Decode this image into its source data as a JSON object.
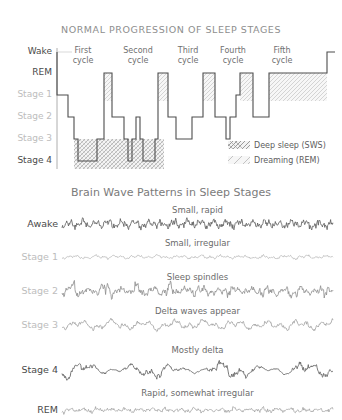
{
  "title": "NORMAL PROGRESSION OF SLEEP STAGES",
  "subtitle": "Brain Wave Patterns in Sleep Stages",
  "hypnogram": {
    "y_axis_labels": [
      {
        "label": "Wake",
        "y": 52,
        "tone": "dark"
      },
      {
        "label": "REM",
        "y": 73,
        "tone": "dark"
      },
      {
        "label": "Stage 1",
        "y": 95,
        "tone": "light"
      },
      {
        "label": "Stage 2",
        "y": 117,
        "tone": "light"
      },
      {
        "label": "Stage 3",
        "y": 139,
        "tone": "light"
      },
      {
        "label": "Stage 4",
        "y": 161,
        "tone": "dark"
      }
    ],
    "cycle_labels": [
      {
        "line1": "First",
        "line2": "cycle",
        "cx": 83
      },
      {
        "line1": "Second",
        "line2": "cycle",
        "cx": 138
      },
      {
        "line1": "Third",
        "line2": "cycle",
        "cx": 188
      },
      {
        "line1": "Fourth",
        "line2": "cycle",
        "cx": 233
      },
      {
        "line1": "Fifth",
        "line2": "cycle",
        "cx": 282
      }
    ],
    "legend": [
      {
        "label": "Deep sleep (SWS)",
        "pattern": "sws-fill"
      },
      {
        "label": "Dreaming (REM)",
        "pattern": "rem-fill"
      }
    ],
    "stage_levels": {
      "Wake": 52,
      "REM": 73,
      "Stage 1": 95,
      "Stage 2": 117,
      "Stage 3": 139,
      "Stage 4": 161
    },
    "trace_color": "#4d4d4d",
    "axis_color": "#9a9a9a",
    "trace_points": [
      [
        57,
        52
      ],
      [
        57,
        95
      ],
      [
        68,
        95
      ],
      [
        68,
        117
      ],
      [
        74,
        117
      ],
      [
        74,
        139
      ],
      [
        78,
        139
      ],
      [
        78,
        161
      ],
      [
        97,
        161
      ],
      [
        97,
        139
      ],
      [
        104,
        139
      ],
      [
        104,
        73
      ],
      [
        112,
        73
      ],
      [
        112,
        117
      ],
      [
        124,
        117
      ],
      [
        124,
        139
      ],
      [
        128,
        139
      ],
      [
        128,
        161
      ],
      [
        132,
        161
      ],
      [
        132,
        139
      ],
      [
        136,
        139
      ],
      [
        136,
        117
      ],
      [
        140,
        117
      ],
      [
        140,
        139
      ],
      [
        143,
        139
      ],
      [
        143,
        161
      ],
      [
        155,
        161
      ],
      [
        155,
        139
      ],
      [
        158,
        139
      ],
      [
        158,
        73
      ],
      [
        168,
        73
      ],
      [
        168,
        117
      ],
      [
        176,
        117
      ],
      [
        176,
        139
      ],
      [
        192,
        139
      ],
      [
        192,
        117
      ],
      [
        203,
        117
      ],
      [
        203,
        73
      ],
      [
        215,
        73
      ],
      [
        215,
        117
      ],
      [
        226,
        117
      ],
      [
        226,
        139
      ],
      [
        230,
        139
      ],
      [
        230,
        117
      ],
      [
        236,
        117
      ],
      [
        236,
        95
      ],
      [
        240,
        95
      ],
      [
        240,
        73
      ],
      [
        253,
        73
      ],
      [
        253,
        117
      ],
      [
        269,
        117
      ],
      [
        269,
        73
      ],
      [
        327,
        73
      ],
      [
        327,
        52
      ],
      [
        335,
        52
      ]
    ],
    "sws_regions": [
      {
        "x": 74,
        "w": 50,
        "y": 139,
        "h": 30
      },
      {
        "x": 124,
        "w": 40,
        "y": 139,
        "h": 30
      }
    ],
    "rem_regions": [
      {
        "x": 104,
        "w": 8,
        "y": 73,
        "h": 28
      },
      {
        "x": 158,
        "w": 10,
        "y": 73,
        "h": 28
      },
      {
        "x": 203,
        "w": 12,
        "y": 73,
        "h": 28
      },
      {
        "x": 240,
        "w": 13,
        "y": 73,
        "h": 28
      },
      {
        "x": 269,
        "w": 58,
        "y": 73,
        "h": 28
      }
    ]
  },
  "eeg": {
    "rows": [
      {
        "label": "Awake",
        "tone": "dark",
        "caption": "Small, rapid",
        "y": 44,
        "cap_y": 26,
        "amp": 7.0,
        "freq": 1.0,
        "rough": 1.0,
        "stroke": "#5a5a5a",
        "width": 0.8
      },
      {
        "label": "Stage 1",
        "tone": "light",
        "caption": "Small, irregular",
        "y": 77,
        "cap_y": 59,
        "amp": 3.2,
        "freq": 0.62,
        "rough": 0.7,
        "stroke": "#b0b0b0",
        "width": 0.7
      },
      {
        "label": "Stage 2",
        "tone": "light",
        "caption": "Sleep spindles",
        "y": 111,
        "cap_y": 93,
        "amp": 6.5,
        "freq": 0.8,
        "rough": 0.85,
        "stroke": "#8d8d8d",
        "width": 0.8
      },
      {
        "label": "Stage 3",
        "tone": "light",
        "caption": "Delta waves appear",
        "y": 145,
        "cap_y": 127,
        "amp": 8.0,
        "freq": 0.42,
        "rough": 0.55,
        "stroke": "#a0a0a0",
        "width": 0.8
      },
      {
        "label": "Stage 4",
        "tone": "dark",
        "caption": "Mostly delta",
        "y": 190,
        "cap_y": 166,
        "amp": 13.0,
        "freq": 0.3,
        "rough": 0.45,
        "stroke": "#6b6b6b",
        "width": 0.9
      },
      {
        "label": "REM",
        "tone": "dark",
        "caption": "Rapid, somewhat irregular",
        "y": 230,
        "cap_y": 209,
        "amp": 4.0,
        "freq": 0.95,
        "rough": 0.95,
        "stroke": "#9a9a9a",
        "width": 0.7
      }
    ],
    "x_start": 62,
    "x_end": 333
  }
}
